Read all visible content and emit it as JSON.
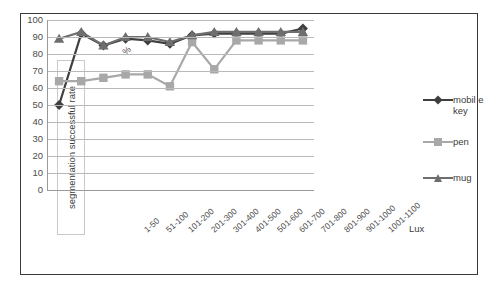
{
  "figure": {
    "y_axis_title": "segmentation successful rate",
    "percent_symbol": "%",
    "x_axis_label": "Lux"
  },
  "chart_data": {
    "type": "line",
    "title": "",
    "xlabel": "Lux",
    "ylabel": "segmentation successful rate",
    "yunit": "%",
    "ylim": [
      0,
      100
    ],
    "yticks": [
      100,
      90,
      80,
      70,
      60,
      50,
      40,
      30,
      20,
      10,
      0
    ],
    "grid": true,
    "legend_position": "right",
    "categories": [
      "1-50",
      "51-100",
      "101-200",
      "201-300",
      "301-400",
      "401-500",
      "501-600",
      "601-700",
      "701-800",
      "801-900",
      "901-1000",
      "1001-1100"
    ],
    "series": [
      {
        "name": "mobile key",
        "legend_label": "mobil e key",
        "color": "#3f3f3f",
        "marker": "diamond",
        "values": [
          50,
          92,
          85,
          89,
          88,
          86,
          91,
          92,
          92,
          92,
          92,
          95
        ]
      },
      {
        "name": "pen",
        "legend_label": "pen",
        "color": "#a8a8a8",
        "marker": "square",
        "values": [
          64,
          64,
          66,
          68,
          68,
          61,
          87,
          71,
          88,
          88,
          88,
          88
        ]
      },
      {
        "name": "mug",
        "legend_label": "mug",
        "color": "#6e6e6e",
        "marker": "triangle",
        "values": [
          89,
          93,
          85,
          90,
          90,
          87,
          91,
          93,
          93,
          93,
          93,
          93
        ]
      }
    ]
  },
  "colors": {
    "frame": "#3a3a3a",
    "gridline": "#b9b9b9",
    "axis": "#9a9a9a",
    "text": "#3b3b3b"
  }
}
